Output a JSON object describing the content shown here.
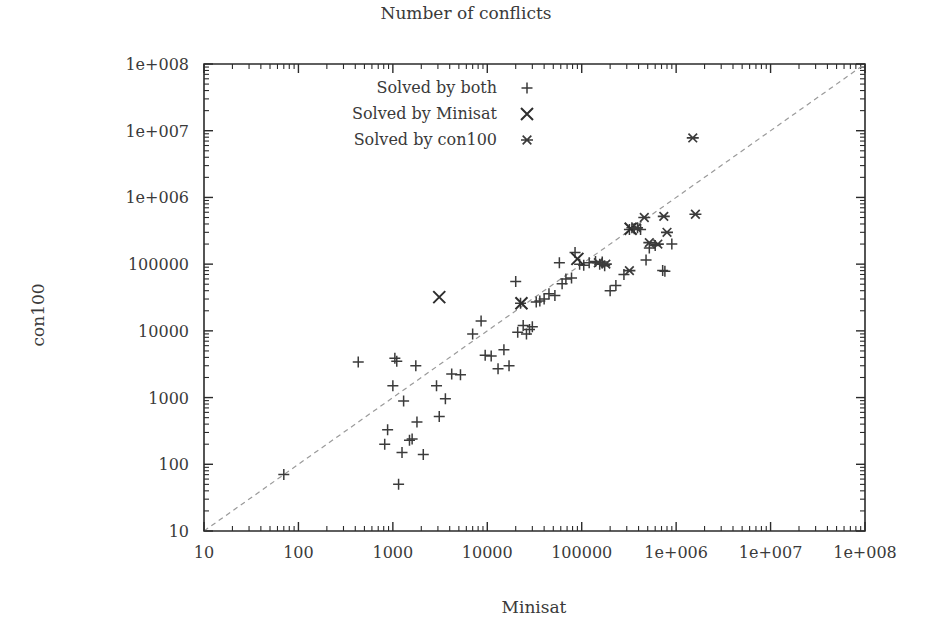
{
  "chart_data": {
    "type": "scatter",
    "title": "Number of conflicts",
    "xlabel": "Minisat",
    "ylabel": "con100",
    "xscale": "log",
    "yscale": "log",
    "xlim": [
      10,
      100000000
    ],
    "ylim": [
      10,
      100000000
    ],
    "grid": false,
    "legend_position": "top-center-inside",
    "xticks": [
      "10",
      "100",
      "1000",
      "10000",
      "100000",
      "1e+006",
      "1e+007",
      "1e+008"
    ],
    "xtick_values": [
      10,
      100,
      1000,
      10000,
      100000,
      1000000,
      10000000,
      100000000
    ],
    "yticks": [
      "10",
      "100",
      "1000",
      "10000",
      "100000",
      "1e+006",
      "1e+007",
      "1e+008"
    ],
    "ytick_values": [
      10,
      100,
      1000,
      10000,
      100000,
      1000000,
      10000000,
      100000000
    ],
    "reference_line": {
      "label": "y = x diagonal",
      "from": [
        10,
        10
      ],
      "to": [
        100000000,
        100000000
      ],
      "style": "dashed"
    },
    "series": [
      {
        "name": "Solved by both",
        "marker": "plus",
        "points": [
          [
            70,
            70
          ],
          [
            430,
            3400
          ],
          [
            820,
            200
          ],
          [
            880,
            330
          ],
          [
            1000,
            1500
          ],
          [
            1050,
            3900
          ],
          [
            1100,
            3500
          ],
          [
            1150,
            50
          ],
          [
            1250,
            150
          ],
          [
            1300,
            890
          ],
          [
            1500,
            230
          ],
          [
            1600,
            240
          ],
          [
            1750,
            3000
          ],
          [
            1800,
            430
          ],
          [
            2100,
            140
          ],
          [
            2900,
            1500
          ],
          [
            3100,
            520
          ],
          [
            3600,
            960
          ],
          [
            4200,
            2250
          ],
          [
            5200,
            2200
          ],
          [
            7000,
            9000
          ],
          [
            8600,
            14000
          ],
          [
            9500,
            4300
          ],
          [
            11000,
            4200
          ],
          [
            13000,
            2700
          ],
          [
            15000,
            5200
          ],
          [
            17000,
            3000
          ],
          [
            20000,
            55000
          ],
          [
            21000,
            9500
          ],
          [
            22500,
            26000
          ],
          [
            24000,
            12000
          ],
          [
            26000,
            9000
          ],
          [
            28000,
            10500
          ],
          [
            30000,
            11500
          ],
          [
            33000,
            27000
          ],
          [
            36000,
            28000
          ],
          [
            40000,
            30000
          ],
          [
            45000,
            36000
          ],
          [
            52000,
            34000
          ],
          [
            58000,
            105000
          ],
          [
            62000,
            51000
          ],
          [
            68000,
            60000
          ],
          [
            78000,
            62000
          ],
          [
            85000,
            150000
          ],
          [
            95000,
            100000
          ],
          [
            105000,
            96000
          ],
          [
            120000,
            105000
          ],
          [
            140000,
            110000
          ],
          [
            155000,
            100000
          ],
          [
            165000,
            108000
          ],
          [
            175000,
            95000
          ],
          [
            200000,
            40000
          ],
          [
            230000,
            48000
          ],
          [
            280000,
            70000
          ],
          [
            320000,
            330000
          ],
          [
            340000,
            350000
          ],
          [
            360000,
            340000
          ],
          [
            390000,
            350000
          ],
          [
            420000,
            330000
          ],
          [
            480000,
            115000
          ],
          [
            520000,
            175000
          ],
          [
            600000,
            190000
          ],
          [
            720000,
            80000
          ],
          [
            760000,
            78000
          ],
          [
            900000,
            200000
          ]
        ]
      },
      {
        "name": "Solved by Minisat",
        "marker": "cross",
        "points": [
          [
            3100,
            32000
          ],
          [
            23000,
            26000
          ],
          [
            90000,
            120000
          ],
          [
            330000,
            340000
          ]
        ]
      },
      {
        "name": "Solved by con100",
        "marker": "star",
        "points": [
          [
            150000,
            105000
          ],
          [
            180000,
            100000
          ],
          [
            320000,
            80000
          ],
          [
            380000,
            350000
          ],
          [
            460000,
            500000
          ],
          [
            520000,
            210000
          ],
          [
            640000,
            200000
          ],
          [
            740000,
            520000
          ],
          [
            800000,
            300000
          ],
          [
            1500000,
            7800000
          ],
          [
            1600000,
            560000
          ]
        ]
      }
    ]
  },
  "legend": {
    "items": [
      {
        "label": "Solved by both",
        "marker": "plus"
      },
      {
        "label": "Solved by Minisat",
        "marker": "cross"
      },
      {
        "label": "Solved by con100",
        "marker": "star"
      }
    ]
  }
}
